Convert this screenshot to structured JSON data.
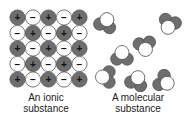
{
  "ionic": {
    "caption_line1": "An ionic",
    "caption_line2": "substance",
    "grid_rows": 5,
    "grid_cols": 5,
    "cation_symbol": "+",
    "anion_symbol": "−",
    "cation_color": "#6e6e6e",
    "anion_color": "#ffffff"
  },
  "molecular": {
    "caption_line1": "A molecular",
    "caption_line2": "substance",
    "molecule_count": 7,
    "large_atom_color": "#ffffff",
    "small_atom_color": "#6e6e6e"
  }
}
